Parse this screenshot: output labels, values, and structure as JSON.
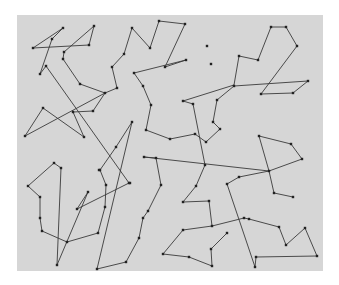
{
  "diagram": {
    "type": "path-graph",
    "canvas": {
      "x": 17,
      "y": 15,
      "width": 306,
      "height": 256,
      "color": "#d6d6d6"
    },
    "colors": {
      "edge": "#3a3a3a",
      "node": "#222222",
      "background": "#ffffff"
    },
    "nodes": [
      [
        33,
        48
      ],
      [
        63,
        28
      ],
      [
        52,
        39
      ],
      [
        40,
        74
      ],
      [
        46,
        66
      ],
      [
        129,
        183
      ],
      [
        130,
        183
      ],
      [
        89,
        45
      ],
      [
        94,
        26
      ],
      [
        64,
        52
      ],
      [
        63,
        59
      ],
      [
        80,
        84
      ],
      [
        105,
        93
      ],
      [
        25,
        136
      ],
      [
        43,
        108
      ],
      [
        84,
        137
      ],
      [
        73,
        112
      ],
      [
        93,
        111
      ],
      [
        117,
        88
      ],
      [
        112,
        67
      ],
      [
        124,
        54
      ],
      [
        132,
        28
      ],
      [
        150,
        48
      ],
      [
        159,
        21
      ],
      [
        185,
        24
      ],
      [
        165,
        67
      ],
      [
        186,
        60
      ],
      [
        134,
        73
      ],
      [
        143,
        86
      ],
      [
        151,
        105
      ],
      [
        146,
        130
      ],
      [
        170,
        139
      ],
      [
        195,
        134
      ],
      [
        206,
        142
      ],
      [
        220,
        129
      ],
      [
        213,
        122
      ],
      [
        217,
        100
      ],
      [
        234,
        86
      ],
      [
        207,
        46
      ],
      [
        211,
        64
      ],
      [
        239,
        56
      ],
      [
        258,
        60
      ],
      [
        271,
        27
      ],
      [
        286,
        27
      ],
      [
        297,
        46
      ],
      [
        261,
        94
      ],
      [
        293,
        93
      ],
      [
        308,
        81
      ],
      [
        193,
        104
      ],
      [
        183,
        101
      ],
      [
        205,
        165
      ],
      [
        196,
        186
      ],
      [
        183,
        202
      ],
      [
        209,
        201
      ],
      [
        212,
        226
      ],
      [
        183,
        230
      ],
      [
        163,
        254
      ],
      [
        189,
        257
      ],
      [
        212,
        266
      ],
      [
        211,
        249
      ],
      [
        227,
        233
      ],
      [
        144,
        157
      ],
      [
        156,
        158
      ],
      [
        161,
        185
      ],
      [
        148,
        211
      ],
      [
        143,
        218
      ],
      [
        139,
        238
      ],
      [
        126,
        262
      ],
      [
        97,
        269
      ],
      [
        132,
        122
      ],
      [
        116,
        147
      ],
      [
        99,
        170
      ],
      [
        54,
        163
      ],
      [
        61,
        168
      ],
      [
        28,
        186
      ],
      [
        40,
        197
      ],
      [
        40,
        218
      ],
      [
        42,
        231
      ],
      [
        67,
        242
      ],
      [
        98,
        233
      ],
      [
        105,
        207
      ],
      [
        106,
        185
      ],
      [
        100,
        170
      ],
      [
        88,
        192
      ],
      [
        77,
        209
      ],
      [
        57,
        265
      ],
      [
        259,
        136
      ],
      [
        291,
        144
      ],
      [
        302,
        159
      ],
      [
        269,
        171
      ],
      [
        239,
        177
      ],
      [
        227,
        184
      ],
      [
        274,
        193
      ],
      [
        293,
        197
      ],
      [
        244,
        218
      ],
      [
        249,
        219
      ],
      [
        279,
        227
      ],
      [
        286,
        245
      ],
      [
        305,
        228
      ],
      [
        317,
        256
      ],
      [
        256,
        257
      ],
      [
        255,
        267
      ]
    ],
    "path": [
      [
        [
          40,
          74
        ],
        [
          52,
          39
        ],
        [
          63,
          28
        ],
        [
          33,
          48
        ],
        [
          89,
          45
        ],
        [
          94,
          26
        ],
        [
          64,
          52
        ],
        [
          63,
          59
        ],
        [
          80,
          84
        ],
        [
          105,
          93
        ],
        [
          25,
          136
        ],
        [
          43,
          108
        ],
        [
          84,
          137
        ],
        [
          73,
          112
        ],
        [
          93,
          111
        ],
        [
          105,
          93
        ],
        [
          117,
          88
        ],
        [
          112,
          67
        ],
        [
          124,
          54
        ],
        [
          132,
          28
        ],
        [
          150,
          48
        ],
        [
          159,
          21
        ],
        [
          185,
          24
        ],
        [
          165,
          67
        ],
        [
          186,
          60
        ],
        [
          134,
          73
        ],
        [
          143,
          86
        ],
        [
          151,
          105
        ],
        [
          146,
          130
        ],
        [
          170,
          139
        ],
        [
          195,
          134
        ],
        [
          206,
          142
        ],
        [
          220,
          129
        ],
        [
          213,
          122
        ],
        [
          217,
          100
        ],
        [
          234,
          86
        ],
        [
          308,
          81
        ],
        [
          293,
          93
        ],
        [
          261,
          94
        ],
        [
          297,
          46
        ],
        [
          286,
          27
        ],
        [
          271,
          27
        ],
        [
          258,
          60
        ],
        [
          239,
          56
        ],
        [
          234,
          85
        ],
        [
          183,
          101
        ],
        [
          193,
          104
        ],
        [
          205,
          165
        ],
        [
          196,
          186
        ],
        [
          183,
          202
        ],
        [
          209,
          201
        ],
        [
          212,
          226
        ],
        [
          183,
          230
        ],
        [
          163,
          254
        ],
        [
          189,
          257
        ],
        [
          212,
          266
        ],
        [
          211,
          249
        ],
        [
          227,
          233
        ]
      ],
      [
        [
          40,
          74
        ],
        [
          46,
          66
        ],
        [
          129,
          183
        ],
        [
          77,
          209
        ],
        [
          88,
          192
        ],
        [
          57,
          265
        ],
        [
          61,
          168
        ],
        [
          54,
          163
        ],
        [
          28,
          186
        ],
        [
          40,
          197
        ],
        [
          40,
          218
        ],
        [
          42,
          231
        ],
        [
          67,
          242
        ],
        [
          98,
          233
        ],
        [
          105,
          207
        ],
        [
          106,
          185
        ],
        [
          100,
          170
        ],
        [
          116,
          147
        ],
        [
          132,
          122
        ],
        [
          97,
          269
        ],
        [
          126,
          262
        ],
        [
          139,
          238
        ],
        [
          143,
          218
        ],
        [
          148,
          211
        ],
        [
          161,
          185
        ],
        [
          156,
          158
        ],
        [
          144,
          157
        ],
        [
          269,
          171
        ],
        [
          259,
          136
        ],
        [
          291,
          144
        ],
        [
          302,
          159
        ],
        [
          269,
          171
        ]
      ],
      [
        [
          239,
          177
        ],
        [
          227,
          184
        ],
        [
          255,
          267
        ],
        [
          256,
          257
        ],
        [
          317,
          256
        ],
        [
          305,
          228
        ],
        [
          286,
          245
        ],
        [
          279,
          227
        ],
        [
          249,
          219
        ],
        [
          244,
          218
        ],
        [
          212,
          226
        ]
      ],
      [
        [
          239,
          177
        ],
        [
          269,
          171
        ],
        [
          274,
          193
        ],
        [
          293,
          197
        ]
      ]
    ]
  }
}
